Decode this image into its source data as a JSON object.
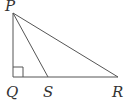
{
  "diagram": {
    "type": "right-triangle",
    "stroke_color": "#555555",
    "points": {
      "P": {
        "label": "P",
        "x": 13,
        "y": 13
      },
      "Q": {
        "label": "Q",
        "x": 13,
        "y": 77
      },
      "S": {
        "label": "S",
        "x": 48,
        "y": 77
      },
      "R": {
        "label": "R",
        "x": 118,
        "y": 77
      }
    },
    "segments": [
      "PQ",
      "QR",
      "PR",
      "PS"
    ],
    "right_angle_at": "Q"
  }
}
